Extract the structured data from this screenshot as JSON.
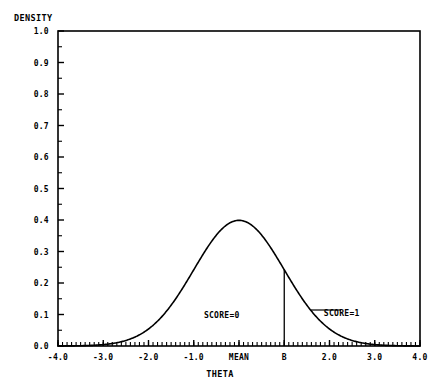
{
  "chart_data": {
    "type": "line",
    "title": "",
    "xlabel": "THETA",
    "ylabel": "DENSITY",
    "xlim": [
      -4.0,
      4.0
    ],
    "ylim": [
      0.0,
      1.0
    ],
    "grid": false,
    "legend_position": "none",
    "x_tick_values": [
      -4.0,
      -3.0,
      -2.0,
      -1.0,
      0.0,
      1.0,
      2.0,
      3.0,
      4.0
    ],
    "x_tick_labels": [
      "-4.0",
      "-3.0",
      "-2.0",
      "-1.0",
      "MEAN",
      "B",
      "2.0",
      "3.0",
      "4.0"
    ],
    "y_tick_values": [
      0.0,
      0.1,
      0.2,
      0.3,
      0.4,
      0.5,
      0.6,
      0.7,
      0.8,
      0.9,
      1.0
    ],
    "y_tick_labels": [
      "0.0",
      "0.1",
      "0.2",
      "0.3",
      "0.4",
      "0.5",
      "0.6",
      "0.7",
      "0.8",
      "0.9",
      "1.0"
    ],
    "x_minor_ticks_per_interval": 10,
    "y_minor_ticks_per_interval": 2,
    "series": [
      {
        "name": "normal-density",
        "mean": 0.0,
        "sd": 1.0,
        "peak_value": 0.399,
        "x": [
          -4.0,
          -3.6,
          -3.2,
          -2.8,
          -2.4,
          -2.0,
          -1.6,
          -1.2,
          -0.8,
          -0.4,
          0.0,
          0.4,
          0.8,
          1.2,
          1.6,
          2.0,
          2.4,
          2.8,
          3.2,
          3.6,
          4.0
        ],
        "values": [
          0.0001,
          0.0006,
          0.0024,
          0.0079,
          0.0224,
          0.054,
          0.1109,
          0.1942,
          0.2897,
          0.3683,
          0.3989,
          0.3683,
          0.2897,
          0.1942,
          0.1109,
          0.054,
          0.0224,
          0.0079,
          0.0024,
          0.0006,
          0.0001
        ]
      }
    ],
    "markers": [
      {
        "name": "cut-point-b",
        "label": "B",
        "x_value": 1.0,
        "y_from": 0.0,
        "y_to": 0.242
      }
    ],
    "annotations": [
      {
        "name": "score-0",
        "text": "SCORE=0",
        "x_value": -0.38,
        "y_value": 0.088
      },
      {
        "name": "score-1",
        "text": "SCORE=1",
        "x_value": 2.27,
        "y_value": 0.096
      }
    ]
  },
  "axis": {
    "y_title": "DENSITY",
    "x_title": "THETA"
  }
}
